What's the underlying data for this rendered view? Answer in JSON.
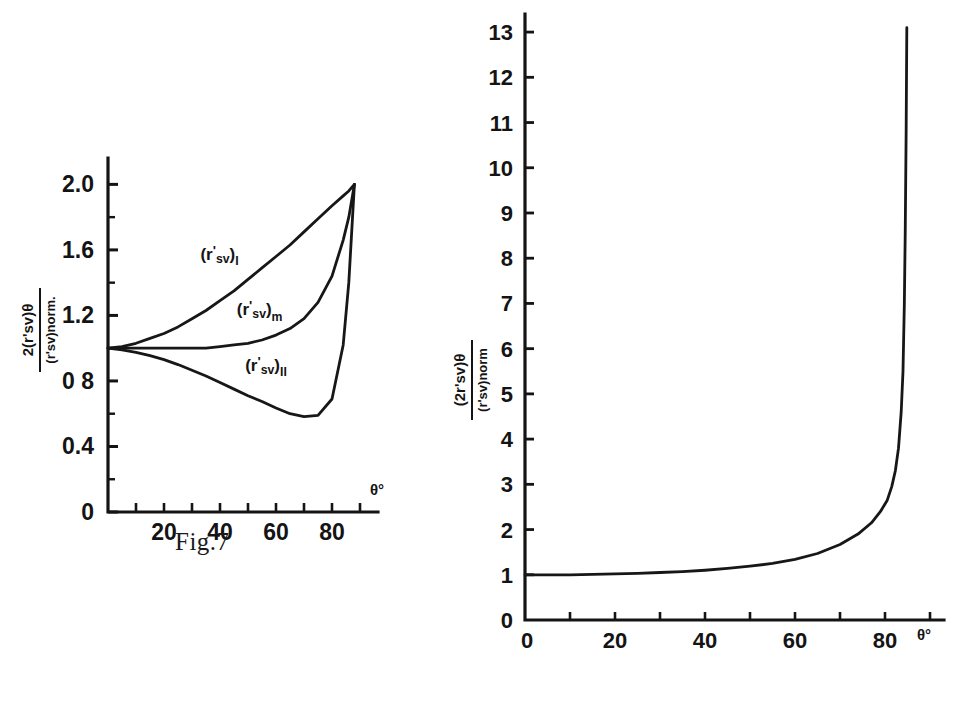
{
  "page": {
    "background": "#ffffff",
    "ink_color": "#141414"
  },
  "figures": [
    {
      "id": "fig7",
      "caption": "Fig.7",
      "xlabel": "θ°",
      "y_numerator": "2(r'sv)θ",
      "y_denominator": "(r'sv)norm.",
      "x_ticks": [
        "20",
        "40",
        "60",
        "80"
      ],
      "y_ticks": [
        "0",
        "0.4",
        "0 8",
        "1.2",
        "1.6",
        "2.0"
      ],
      "curve_labels": [
        "(r'sv)I",
        "(r'sv)m",
        "(r'sv)II"
      ]
    },
    {
      "id": "fig8",
      "caption": "Fig.8",
      "xlabel": "θ°",
      "y_numerator": "(2r'sv)θ",
      "y_denominator": "(r'sv)norm",
      "x_ticks": [
        "0",
        "20",
        "40",
        "60",
        "80"
      ],
      "y_ticks": [
        "0",
        "1",
        "2",
        "3",
        "4",
        "5",
        "6",
        "7",
        "8",
        "9",
        "10",
        "11",
        "12",
        "13"
      ]
    }
  ],
  "chart_data": [
    {
      "type": "line",
      "id": "fig7",
      "title": "Fig.7",
      "xlabel": "θ°",
      "ylabel": "2(r'sv)θ / (r'sv)norm.",
      "xlim": [
        0,
        90
      ],
      "ylim": [
        0,
        2.1
      ],
      "xticks": [
        0,
        10,
        20,
        30,
        40,
        50,
        60,
        70,
        80,
        90
      ],
      "xticklabels": [
        "",
        "",
        "20",
        "",
        "40",
        "",
        "60",
        "",
        "80",
        ""
      ],
      "yticks": [
        0,
        0.2,
        0.4,
        0.6,
        0.8,
        1.0,
        1.2,
        1.4,
        1.6,
        1.8,
        2.0
      ],
      "yticklabels": [
        "0",
        "",
        "0.4",
        "",
        "0 8",
        "",
        "1.2",
        "",
        "1.6",
        "",
        "2.0"
      ],
      "grid": false,
      "legend": "inline-annotations",
      "x": [
        0,
        5,
        10,
        15,
        20,
        25,
        30,
        35,
        40,
        45,
        50,
        55,
        60,
        65,
        70,
        75,
        80,
        84,
        86,
        88
      ],
      "series": [
        {
          "name": "(r'sv)I",
          "label_position": [
            33,
            1.54
          ],
          "values": [
            1.0,
            1.01,
            1.03,
            1.06,
            1.09,
            1.13,
            1.18,
            1.23,
            1.29,
            1.35,
            1.42,
            1.49,
            1.56,
            1.63,
            1.71,
            1.79,
            1.87,
            1.93,
            1.96,
            2.0
          ]
        },
        {
          "name": "(r'sv)m",
          "label_position": [
            46,
            1.2
          ],
          "values": [
            1.0,
            1.0,
            1.0,
            1.0,
            1.0,
            1.0,
            1.0,
            1.0,
            1.01,
            1.02,
            1.03,
            1.05,
            1.08,
            1.12,
            1.18,
            1.28,
            1.44,
            1.66,
            1.8,
            2.0
          ]
        },
        {
          "name": "(r'sv)II",
          "label_position": [
            49,
            0.86
          ],
          "values": [
            1.0,
            0.99,
            0.975,
            0.955,
            0.93,
            0.9,
            0.865,
            0.83,
            0.79,
            0.75,
            0.71,
            0.675,
            0.635,
            0.6,
            0.582,
            0.59,
            0.69,
            1.02,
            1.4,
            2.0
          ]
        }
      ]
    },
    {
      "type": "line",
      "id": "fig8",
      "title": "Fig.8",
      "xlabel": "θ°",
      "ylabel": "(2r'sv)θ / (r'sv)norm",
      "xlim": [
        0,
        90
      ],
      "ylim": [
        0,
        13.4
      ],
      "xticks": [
        0,
        10,
        20,
        30,
        40,
        50,
        60,
        70,
        80,
        90
      ],
      "xticklabels": [
        "0",
        "",
        "20",
        "",
        "40",
        "",
        "60",
        "",
        "80",
        ""
      ],
      "yticks": [
        0,
        1,
        2,
        3,
        4,
        5,
        6,
        7,
        8,
        9,
        10,
        11,
        12,
        13
      ],
      "grid": false,
      "x": [
        0,
        5,
        10,
        15,
        20,
        25,
        30,
        35,
        40,
        45,
        50,
        55,
        60,
        65,
        70,
        74,
        77,
        79,
        80.5,
        81.5,
        82.3,
        83,
        83.6,
        84,
        84.3,
        84.5,
        84.7,
        84.85
      ],
      "values": [
        1.0,
        1.0,
        1.0,
        1.01,
        1.02,
        1.03,
        1.05,
        1.07,
        1.1,
        1.14,
        1.19,
        1.25,
        1.34,
        1.47,
        1.67,
        1.9,
        2.15,
        2.4,
        2.65,
        2.95,
        3.3,
        3.8,
        4.6,
        5.5,
        7.0,
        8.6,
        10.8,
        13.1
      ]
    }
  ]
}
